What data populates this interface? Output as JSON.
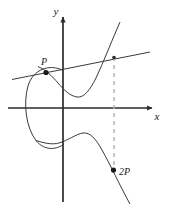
{
  "figure": {
    "background_color": "#ffffff",
    "width": 172,
    "height": 218
  },
  "axes": {
    "x_label": "x",
    "y_label": "y",
    "color": "#2b2b2b",
    "origin": {
      "x": 63,
      "y": 108
    },
    "x_axis": {
      "x1": 8,
      "y1": 108,
      "x2": 155,
      "y2": 108
    },
    "y_axis": {
      "x1": 63,
      "y1": 200,
      "x2": 63,
      "y2": 14
    }
  },
  "labels": {
    "p": "P",
    "two_p": "2P",
    "x": "x",
    "y": "y"
  },
  "points": [
    {
      "name": "P",
      "label": "P",
      "x": 46,
      "y": 72,
      "label_x": 43,
      "label_y": 64
    },
    {
      "name": "2P",
      "label": "2P",
      "x": 113,
      "y": 170,
      "label_x": 119,
      "label_y": 174
    }
  ],
  "curve": {
    "color": "#3a3a3a",
    "stroke_width": 1,
    "oval_path": "M 63,70.5 C 50,64 33,69 28,86 C 23,103 26,127 36,140 C 45,151 58,149 63,143",
    "right_branch_path": "M 63,69 C 68,73 74,82 80,91 C 85,98 90,99 95,93 C 101,85 109,67 117,48 C 122,35 126,26 129,20",
    "lower_left_path": "M 63,143 C 68,140 74,137 80,134.5",
    "lower_branch_path": "M 63,146 C 70,141 77,135 84,133 C 91,131.5 97,137 103,148 C 109,159 118,180 126,195 C 129,200 131,203 133,206"
  },
  "tangent_line": {
    "color": "#3a3a3a",
    "stroke_width": 1,
    "path": "M 12,79 L 150,52"
  },
  "dashed_line": {
    "color": "#b0b0b0",
    "stroke_width": 1.4,
    "dash_pattern": "4,4",
    "x": 114,
    "y_top": 57,
    "y_bottom": 169
  },
  "intersection_point": {
    "name": "tangent-curve-intersection",
    "x": 114,
    "y": 58
  }
}
